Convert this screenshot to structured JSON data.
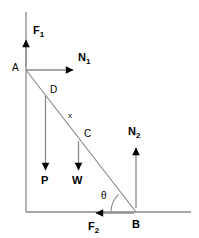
{
  "figure": {
    "colors": {
      "line": "#8a8a8a",
      "ink": "#000000",
      "background": "#ffffff"
    },
    "points": {
      "a": {
        "label": "A",
        "x": 26,
        "y": 70
      },
      "b": {
        "label": "B",
        "x": 136,
        "y": 212
      },
      "c": {
        "label": "C",
        "x": 82,
        "y": 136
      },
      "d": {
        "label": "D",
        "x": 48,
        "y": 93
      }
    },
    "segments": {
      "ladder": {
        "label": "x",
        "from": "A",
        "to": "B"
      }
    },
    "angle": {
      "label": "θ",
      "at": "B"
    },
    "forces": [
      {
        "name": "F1",
        "base": "F",
        "subscript": "1",
        "direction": "up",
        "applied_at": "A"
      },
      {
        "name": "N1",
        "base": "N",
        "subscript": "1",
        "direction": "right",
        "applied_at": "A"
      },
      {
        "name": "P",
        "base": "P",
        "subscript": "",
        "direction": "down",
        "applied_at": "D"
      },
      {
        "name": "W",
        "base": "W",
        "subscript": "",
        "direction": "down",
        "applied_at": "C"
      },
      {
        "name": "N2",
        "base": "N",
        "subscript": "2",
        "direction": "up",
        "applied_at": "B"
      },
      {
        "name": "F2",
        "base": "F",
        "subscript": "2",
        "direction": "left",
        "applied_at": "B"
      }
    ],
    "labels": {
      "f1_base": "F",
      "f1_sub": "1",
      "n1_base": "N",
      "n1_sub": "1",
      "n2_base": "N",
      "n2_sub": "2",
      "f2_base": "F",
      "f2_sub": "2",
      "p": "P",
      "w": "W",
      "a": "A",
      "b": "B",
      "c": "C",
      "d": "D",
      "x": "x",
      "theta": "θ"
    }
  }
}
